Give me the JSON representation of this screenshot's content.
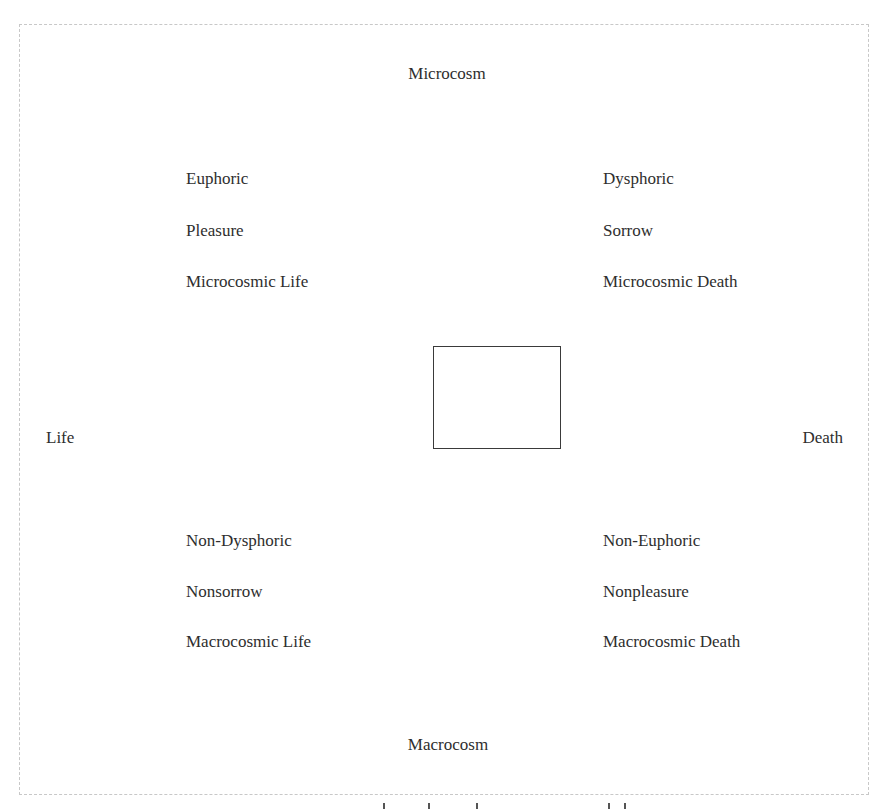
{
  "diagram": {
    "type": "semiotic-square",
    "poles": {
      "top": "Microcosm",
      "bottom": "Macrocosm",
      "left": "Life",
      "right": "Death"
    },
    "quadrants": {
      "top_left": [
        "Euphoric",
        "Pleasure",
        "Microcosmic Life"
      ],
      "top_right": [
        "Dysphoric",
        "Sorrow",
        "Microcosmic Death"
      ],
      "bottom_left": [
        "Non-Dysphoric",
        "Nonsorrow",
        "Macrocosmic Life"
      ],
      "bottom_right": [
        "Non-Euphoric",
        "Nonpleasure",
        "Macrocosmic Death"
      ]
    },
    "colors": {
      "text": "#2e2e2e",
      "frame_border": "#c8c8c8",
      "square_border": "#3a3a3a",
      "background": "#ffffff"
    }
  }
}
